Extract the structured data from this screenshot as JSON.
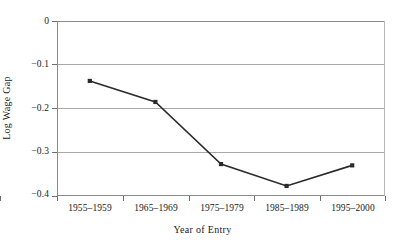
{
  "chart_data": {
    "type": "line",
    "title": "",
    "xlabel": "Year of Entry",
    "ylabel": "Log Wage Gap",
    "categories": [
      "1955–1959",
      "1965–1969",
      "1975–1979",
      "1985–1989",
      "1995–2000"
    ],
    "values": [
      -0.137,
      -0.185,
      -0.327,
      -0.377,
      -0.33
    ],
    "series": [
      {
        "name": "Log Wage Gap",
        "values": [
          -0.137,
          -0.185,
          -0.327,
          -0.377,
          -0.33
        ]
      }
    ],
    "ylim": [
      -0.4,
      0
    ],
    "ytick_labels": [
      "0",
      "−0.1",
      "−0.2",
      "−0.3",
      "−0.4"
    ],
    "ytick_values": [
      0,
      -0.1,
      -0.2,
      -0.3,
      -0.4
    ],
    "grid": "horizontal",
    "legend": "none",
    "marker": "square",
    "line_color": "#2b2b2b",
    "grid_color": "#a9a9a9",
    "axis_color": "#8a8a8a",
    "background": "#ffffff"
  }
}
